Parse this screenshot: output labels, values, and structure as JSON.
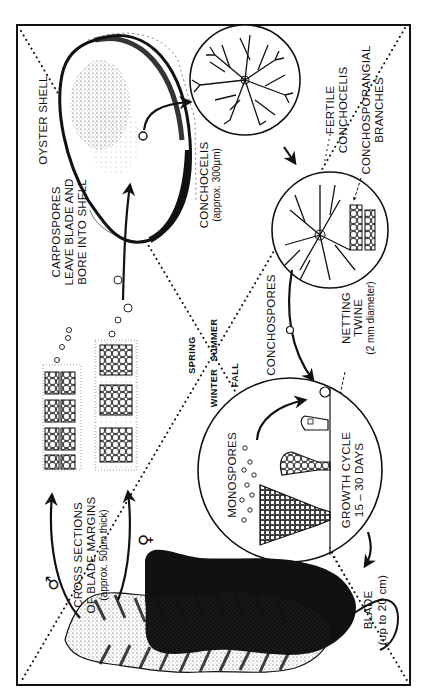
{
  "diagram": {
    "orientation": "rotated 90 degrees counter-clockwise",
    "colors": {
      "ink": "#111111",
      "background": "#ffffff"
    },
    "seasons": {
      "spring": "SPRING",
      "summer": "SUMMER",
      "fall": "FALL",
      "winter": "WINTER"
    },
    "labels": {
      "oyster_shell": "OYSTER SHELL",
      "carpospores": [
        "CARPOSPORES",
        "LEAVE BLADE AND",
        "BORE INTO SHELL"
      ],
      "conchocelis": [
        "CONCHOCELIS",
        "(approx. 300µm)"
      ],
      "fertile_conchocelis": [
        "FERTILE",
        "CONCHOCELIS"
      ],
      "conchosporangial": [
        "CONCHOSPORANGIAL",
        "BRANCHES"
      ],
      "conchospores": "CONCHOSPORES",
      "netting_twine": [
        "NETTING",
        "TWINE",
        "(2 mm diameter)"
      ],
      "monospores": "MONOSPORES",
      "growth_cycle": [
        "GROWTH CYCLE",
        "15 – 30 DAYS"
      ],
      "cross_sections": [
        "CROSS SECTIONS",
        "OF BLADE MARGINS",
        "(approx. 50µm thick)"
      ],
      "male_symbol": "♂",
      "female_symbol": "♀",
      "blade": [
        "BLADE",
        "(up to 20 cm)"
      ]
    }
  }
}
